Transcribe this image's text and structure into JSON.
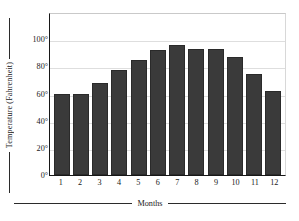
{
  "chart_data": {
    "type": "bar",
    "title": "",
    "xlabel": "Months",
    "ylabel": "Temperature (Fahrenheit)",
    "categories": [
      "1",
      "2",
      "3",
      "4",
      "5",
      "6",
      "7",
      "8",
      "9",
      "10",
      "11",
      "12"
    ],
    "values": [
      60,
      60,
      68,
      77,
      85,
      92,
      96,
      93,
      93,
      87,
      74,
      62
    ],
    "ylim": [
      0,
      120
    ],
    "ytick_values": [
      0,
      20,
      40,
      60,
      80,
      100
    ],
    "ytick_labels": [
      "0°",
      "20°",
      "40°",
      "60°",
      "80°",
      "100°"
    ],
    "gridlines": [
      20,
      40,
      60,
      80,
      100
    ],
    "grid": true,
    "legend": false,
    "legend_position": "none",
    "bar_color": "#3a3a3a",
    "grid_color": "#dedede",
    "axis_color": "#171717",
    "background": "#ffffff"
  }
}
